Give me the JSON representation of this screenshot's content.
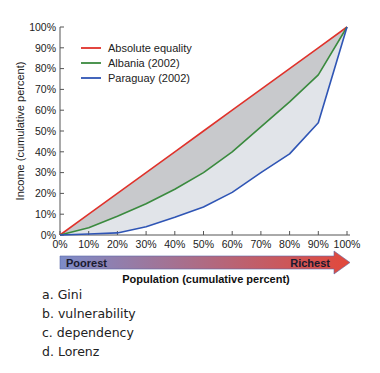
{
  "chart_data": {
    "type": "line",
    "title": "",
    "xlabel": "Population (cumulative percent)",
    "ylabel": "Income (cumulative percent)",
    "x": [
      0,
      10,
      20,
      30,
      40,
      50,
      60,
      70,
      80,
      90,
      100
    ],
    "x_tick_labels": [
      "0%",
      "10%",
      "20%",
      "30%",
      "40%",
      "50%",
      "60%",
      "70%",
      "80%",
      "90%",
      "100%"
    ],
    "y_tick_labels": [
      "0%",
      "10%",
      "20%",
      "30%",
      "40%",
      "50%",
      "60%",
      "70%",
      "80%",
      "90%",
      "100%"
    ],
    "xlim": [
      0,
      100
    ],
    "ylim": [
      0,
      100
    ],
    "grid": false,
    "legend_position": "upper-left",
    "series": [
      {
        "name": "Absolute equality",
        "color": "#e0322b",
        "values": [
          0,
          10,
          20,
          30,
          40,
          50,
          60,
          70,
          80,
          90,
          100
        ]
      },
      {
        "name": "Albania (2002)",
        "color": "#3a8a3e",
        "values": [
          0,
          3.5,
          9,
          15,
          22,
          30,
          40,
          52,
          64,
          77,
          100
        ]
      },
      {
        "name": "Paraguay (2002)",
        "color": "#2f55b5",
        "values": [
          0,
          0.5,
          1,
          4,
          8.5,
          13.5,
          20.5,
          30,
          39,
          54,
          100
        ]
      }
    ],
    "fills": [
      {
        "between": [
          "Absolute equality",
          "Albania (2002)"
        ],
        "color": "#c8c9cc"
      },
      {
        "between": [
          "Albania (2002)",
          "Paraguay (2002)"
        ],
        "color": "#e1e4e9"
      }
    ],
    "annotations": {
      "arrow": {
        "left_label": "Poorest",
        "right_label": "Richest",
        "gradient_start": "#7d8cc9",
        "gradient_end": "#e2483b"
      }
    }
  },
  "question": {
    "options": [
      {
        "letter": "a.",
        "text": "Gini"
      },
      {
        "letter": "b.",
        "text": "vulnerability"
      },
      {
        "letter": "c.",
        "text": "dependency"
      },
      {
        "letter": "d.",
        "text": "Lorenz"
      }
    ]
  }
}
